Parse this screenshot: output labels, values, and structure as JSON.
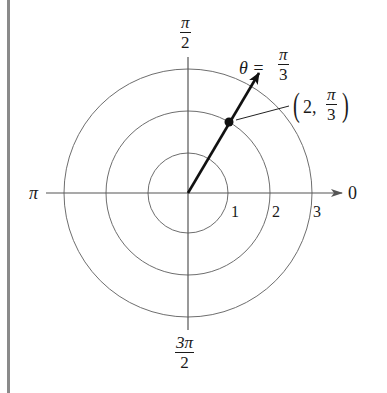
{
  "diagram": {
    "type": "polar-coordinate-plot",
    "center_px": [
      188,
      193
    ],
    "circle_radii_px": [
      40,
      82,
      124
    ],
    "circle_labels": [
      "1",
      "2",
      "3"
    ],
    "axis_labels": {
      "right": "0",
      "left": "π",
      "top": {
        "num": "π",
        "den": "2"
      },
      "bottom": {
        "num": "3π",
        "den": "2"
      }
    },
    "ray": {
      "theta_label_lhs": "θ =",
      "theta_num": "π",
      "theta_den": "3",
      "angle_deg": 60
    },
    "point": {
      "r": "2",
      "label_open": "(",
      "label_r": "2,",
      "label_num": "π",
      "label_den": "3",
      "label_close": ")"
    },
    "colors": {
      "grid": "#6e6e6e",
      "axis": "#555555",
      "ray": "#111111",
      "text": "#1a1a1a",
      "border": "#8a8a8a"
    }
  }
}
